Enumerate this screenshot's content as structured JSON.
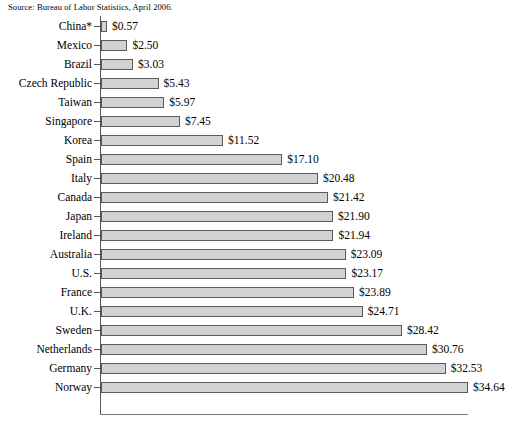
{
  "source_note": "Source: Bureau of Labor Statistics, April 2006.",
  "colors": {
    "bar_fill": "#d2d2d2",
    "bar_border": "#5a5a5a",
    "axis": "#555555",
    "text": "#000000",
    "background": "#ffffff"
  },
  "chart_data": {
    "type": "bar",
    "orientation": "horizontal",
    "title": "",
    "subtitle": "",
    "xlabel": "",
    "ylabel": "",
    "grid": false,
    "legend": null,
    "value_prefix": "$",
    "value_decimals": 2,
    "xlim": [
      0,
      34.64
    ],
    "categories": [
      "China*",
      "Mexico",
      "Brazil",
      "Czech Republic",
      "Taiwan",
      "Singapore",
      "Korea",
      "Spain",
      "Italy",
      "Canada",
      "Japan",
      "Ireland",
      "Australia",
      "U.S.",
      "France",
      "U.K.",
      "Sweden",
      "Netherlands",
      "Germany",
      "Norway"
    ],
    "values": [
      0.57,
      2.5,
      3.03,
      5.43,
      5.97,
      7.45,
      11.52,
      17.1,
      20.48,
      21.42,
      21.9,
      21.94,
      23.09,
      23.17,
      23.89,
      24.71,
      28.42,
      30.76,
      32.53,
      34.64
    ],
    "value_labels": [
      "$0.57",
      "$2.50",
      "$3.03",
      "$5.43",
      "$5.97",
      "$7.45",
      "$11.52",
      "$17.10",
      "$20.48",
      "$21.42",
      "$21.90",
      "$21.94",
      "$23.09",
      "$23.17",
      "$23.89",
      "$24.71",
      "$28.42",
      "$30.76",
      "$32.53",
      "$34.64"
    ],
    "annotations": [
      "Source: Bureau of Labor Statistics, April 2006."
    ]
  }
}
